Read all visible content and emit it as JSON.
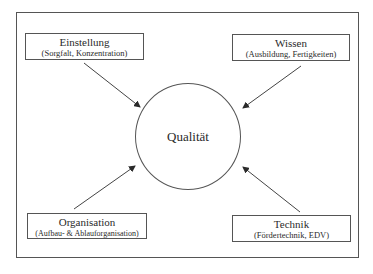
{
  "diagram": {
    "center": {
      "label": "Qualität"
    },
    "factors": [
      {
        "id": "einstellung",
        "title": "Einstellung",
        "subtitle": "(Sorgfalt, Konzentration)",
        "position": "top-left"
      },
      {
        "id": "wissen",
        "title": "Wissen",
        "subtitle": "(Ausbildung, Fertigkeiten)",
        "position": "top-right"
      },
      {
        "id": "organisation",
        "title": "Organisation",
        "subtitle": "(Aufbau- & Ablauforganisation)",
        "position": "bottom-left"
      },
      {
        "id": "technik",
        "title": "Technik",
        "subtitle": "(Fördertechnik, EDV)",
        "position": "bottom-right"
      }
    ],
    "colors": {
      "stroke": "#555555",
      "text": "#2a2a2a",
      "background": "#ffffff"
    }
  }
}
